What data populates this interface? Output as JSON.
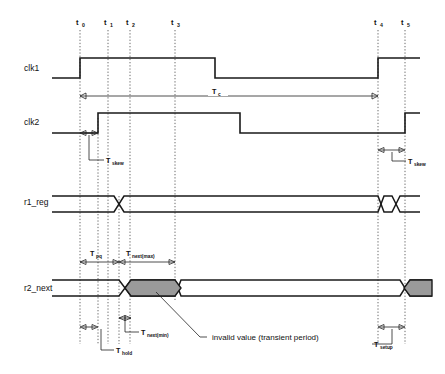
{
  "figure": {
    "kind": "digital-timing-diagram",
    "background_color": "#ffffff",
    "line_color": "#1a1a1a",
    "shade_color": "#9a9a9a"
  },
  "time_markers": [
    {
      "id": "t0",
      "base": "t",
      "sub": "0",
      "x": 80
    },
    {
      "id": "t1",
      "base": "t",
      "sub": "1",
      "x": 108
    },
    {
      "id": "t2",
      "base": "t",
      "sub": "2",
      "x": 130
    },
    {
      "id": "t3",
      "base": "t",
      "sub": "3",
      "x": 175
    },
    {
      "id": "t4",
      "base": "t",
      "sub": "4",
      "x": 378
    },
    {
      "id": "t5",
      "base": "t",
      "sub": "5",
      "x": 405
    }
  ],
  "signals": [
    {
      "name": "clk1",
      "label": "clk1",
      "row_y": 68
    },
    {
      "name": "clk2",
      "label": "clk2",
      "row_y": 122
    },
    {
      "name": "r1_reg",
      "label": "r1_reg",
      "row_y": 202
    },
    {
      "name": "r2_next",
      "label": "r2_next",
      "row_y": 288
    }
  ],
  "measurements": [
    {
      "name": "Tc",
      "base": "T",
      "sub": "c",
      "from_x": 80,
      "to_x": 378,
      "y": 96,
      "label_x": 215,
      "label_y": 93
    },
    {
      "name": "Tskew_left",
      "base": "T",
      "sub": "skew",
      "from_x": 80,
      "to_x": 98,
      "y": 133,
      "label_x": 108,
      "label_y": 163
    },
    {
      "name": "Tskew_right",
      "base": "T",
      "sub": "skew",
      "from_x": 378,
      "to_x": 405,
      "y": 150,
      "label_x": 408,
      "label_y": 163
    },
    {
      "name": "Tpq",
      "base": "T",
      "sub": "pq",
      "from_x": 80,
      "to_x": 119,
      "y": 262,
      "label_x": 92,
      "label_y": 256
    },
    {
      "name": "Tnext_max",
      "base": "T",
      "sub": "next(max)",
      "from_x": 119,
      "to_x": 175,
      "y": 262,
      "label_x": 128,
      "label_y": 256
    },
    {
      "name": "Tnext_min",
      "base": "T",
      "sub": "next(min)",
      "from_x": 119,
      "to_x": 131,
      "y": 318,
      "label_x": 141,
      "label_y": 334
    },
    {
      "name": "Thold",
      "base": "T",
      "sub": "hold",
      "from_x": 80,
      "to_x": 98,
      "y": 327,
      "label_x": 116,
      "label_y": 352
    },
    {
      "name": "Tsetup",
      "base": "T",
      "sub": "setup",
      "from_x": 378,
      "to_x": 405,
      "y": 327,
      "label_x": 375,
      "label_y": 345
    }
  ],
  "annotations": [
    {
      "name": "invalid-value-note",
      "text": "invalid value (transient period)",
      "x": 207,
      "y": 340
    }
  ]
}
